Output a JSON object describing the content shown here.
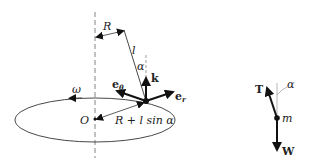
{
  "diagram": {
    "left": {
      "labels": {
        "R": "R",
        "l": "l",
        "alpha": "α",
        "k": "k",
        "e_theta_main": "e",
        "e_theta_sub": "θ",
        "e_r_main": "e",
        "e_r_sub": "r",
        "omega": "ω",
        "O": "O",
        "radius": "R + l sin α"
      }
    },
    "right": {
      "labels": {
        "T": "T",
        "alpha": "α",
        "m": "m",
        "W": "W"
      }
    }
  }
}
